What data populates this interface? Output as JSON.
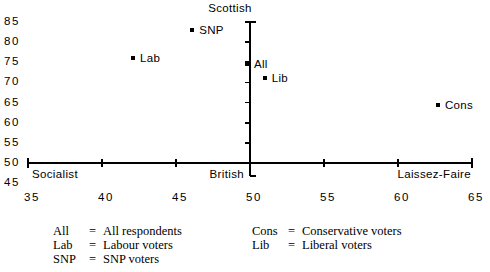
{
  "chart_data": {
    "type": "scatter",
    "title": "",
    "xlabel": "",
    "ylabel": "",
    "xlim": [
      35,
      65
    ],
    "ylim": [
      45,
      85
    ],
    "grid": false,
    "legend_position": "below-plot",
    "x_ticks": [
      "35",
      "40",
      "45",
      "50",
      "55",
      "60",
      "65"
    ],
    "x_tick_values": [
      35,
      40,
      45,
      50,
      55,
      60,
      65
    ],
    "y_ticks": [
      "85",
      "80",
      "75",
      "70",
      "65",
      "60",
      "55",
      "50",
      "45"
    ],
    "y_tick_values": [
      85,
      80,
      75,
      70,
      65,
      60,
      55,
      50,
      45
    ],
    "axis_anchor_labels": {
      "x_left": "Socialist",
      "x_center": "British",
      "x_right": "Laissez-Faire",
      "y_top": "Scottish"
    },
    "points": [
      {
        "label": "SNP",
        "x": 46.1,
        "y": 83.0
      },
      {
        "label": "Lab",
        "x": 42.1,
        "y": 76.0
      },
      {
        "label": "All",
        "x": 49.8,
        "y": 74.5
      },
      {
        "label": "Lib",
        "x": 51.0,
        "y": 71.0
      },
      {
        "label": "Cons",
        "x": 62.7,
        "y": 64.5
      }
    ],
    "axis_origin": {
      "x": 50,
      "y": 50
    },
    "marker_color": "#000000",
    "axis_color": "#000000"
  },
  "legend": {
    "left_column": [
      {
        "key": "All",
        "eq": "=",
        "value": "All respondents"
      },
      {
        "key": "Lab",
        "eq": "=",
        "value": "Labour voters"
      },
      {
        "key": "SNP",
        "eq": "=",
        "value": "SNP voters"
      }
    ],
    "right_column": [
      {
        "key": "Cons",
        "eq": "=",
        "value": "Conservative voters"
      },
      {
        "key": "Lib",
        "eq": "=",
        "value": "Liberal voters"
      }
    ]
  }
}
